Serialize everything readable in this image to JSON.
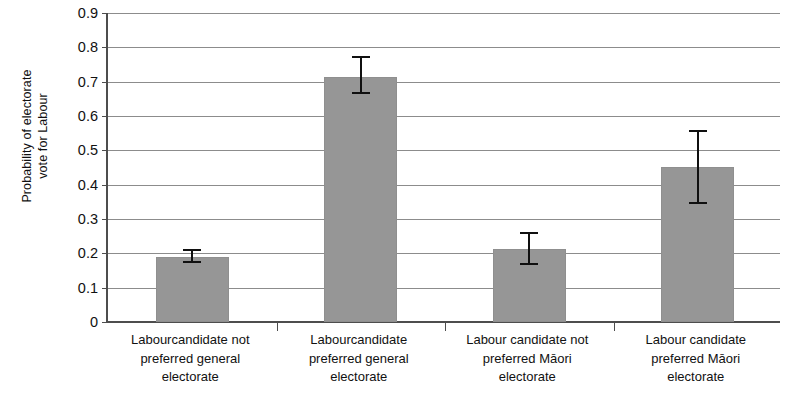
{
  "chart_data": {
    "type": "bar",
    "title": "",
    "subtitle": "",
    "xlabel": "",
    "ylabel": "Probability of electorate\nvote for Labour",
    "ylim": [
      0,
      0.9
    ],
    "ytick_step": 0.1,
    "grid": true,
    "legend": null,
    "legend_position": "none",
    "bar_color": "#969696",
    "errorbar_color": "#101010",
    "axis_color": "#4d4d4d",
    "gridline_color": "#8c8c8c",
    "categories": [
      "Labourcandidate not\npreferred general\nelectorate",
      "Labourcandidate\npreferred general\nelectorate",
      "Labour candidate not\npreferred Māori\nelectorate",
      "Labour candidate\npreferred Māori\nelectorate"
    ],
    "values": [
      0.19,
      0.715,
      0.213,
      0.452
    ],
    "error_low": [
      0.172,
      0.663,
      0.165,
      0.343
    ],
    "error_high": [
      0.212,
      0.775,
      0.262,
      0.558
    ],
    "ytick_labels": [
      "0.9",
      "0.8",
      "0.7",
      "0.6",
      "0.5",
      "0.4",
      "0.3",
      "0.2",
      "0.1",
      "0"
    ],
    "ytick_values": [
      0.9,
      0.8,
      0.7,
      0.6,
      0.5,
      0.4,
      0.3,
      0.2,
      0.1,
      0
    ]
  }
}
